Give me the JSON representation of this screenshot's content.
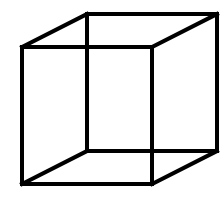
{
  "figure": {
    "type": "necker-cube",
    "background": "#ffffff",
    "stroke_color": "#000000",
    "stroke_width": 4,
    "vertices": {
      "front_top_left": [
        22,
        47
      ],
      "front_top_right": [
        152,
        47
      ],
      "front_bottom_right": [
        152,
        184
      ],
      "front_bottom_left": [
        22,
        184
      ],
      "back_top_left": [
        87,
        14
      ],
      "back_top_right": [
        217,
        14
      ],
      "back_bottom_right": [
        217,
        151
      ],
      "back_bottom_left": [
        87,
        151
      ]
    },
    "edges": [
      [
        "front_top_left",
        "front_top_right"
      ],
      [
        "front_top_right",
        "front_bottom_right"
      ],
      [
        "front_bottom_right",
        "front_bottom_left"
      ],
      [
        "front_bottom_left",
        "front_top_left"
      ],
      [
        "back_top_left",
        "back_top_right"
      ],
      [
        "back_top_right",
        "back_bottom_right"
      ],
      [
        "back_bottom_right",
        "back_bottom_left"
      ],
      [
        "back_bottom_left",
        "back_top_left"
      ],
      [
        "front_top_left",
        "back_top_left"
      ],
      [
        "front_top_right",
        "back_top_right"
      ],
      [
        "front_bottom_right",
        "back_bottom_right"
      ],
      [
        "front_bottom_left",
        "back_bottom_left"
      ]
    ]
  }
}
